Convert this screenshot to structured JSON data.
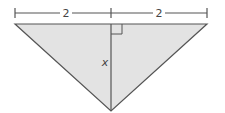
{
  "diagram": {
    "type": "triangle-with-altitude",
    "labels": {
      "left_base": "2",
      "right_base": "2",
      "altitude": "x"
    },
    "colors": {
      "fill": "#e3e3e3",
      "stroke": "#555555",
      "text": "#444444"
    },
    "right_angle_marker": true
  }
}
